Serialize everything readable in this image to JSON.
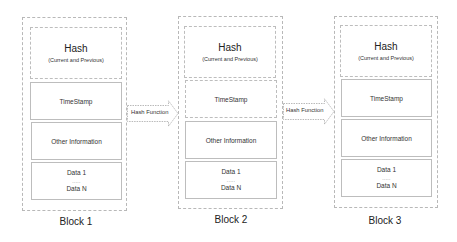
{
  "diagram": {
    "blocks": [
      {
        "caption": "Block 1",
        "hash": {
          "title": "Hash",
          "subtitle": "(Current and Previous)"
        },
        "timestamp": "TimeStamp",
        "other": "Other Information",
        "data": {
          "first": "Data 1",
          "dots": ".....",
          "last": "Data N"
        }
      },
      {
        "caption": "Block 2",
        "hash": {
          "title": "Hash",
          "subtitle": "(Current and Previous)"
        },
        "timestamp": "TimeStamp",
        "other": "Other Information",
        "data": {
          "first": "Data 1",
          "dots": ".....",
          "last": "Data N"
        }
      },
      {
        "caption": "Block 3",
        "hash": {
          "title": "Hash",
          "subtitle": "(Current and Previous)"
        },
        "timestamp": "TimeStamp",
        "other": "Other Information",
        "data": {
          "first": "Data 1",
          "dots": ".....",
          "last": "Data N"
        }
      }
    ],
    "arrows": [
      {
        "label": "Hash Function",
        "from": "Block 1",
        "to": "Block 2"
      },
      {
        "label": "Hash Function",
        "from": "Block 2",
        "to": "Block 3"
      }
    ],
    "colors": {
      "border": "#bdbdbd",
      "dashed_border": "#b8b8b8",
      "text": "#222222",
      "background": "#ffffff"
    }
  }
}
